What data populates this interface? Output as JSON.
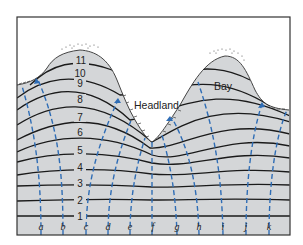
{
  "figure": {
    "labels": {
      "headland": "Headland",
      "bay": "Bay"
    },
    "crest_numbers": [
      "1",
      "2",
      "3",
      "4",
      "5",
      "6",
      "7",
      "8",
      "9",
      "10",
      "11"
    ],
    "orthogonal_letters": [
      "a",
      "b",
      "c",
      "d",
      "e",
      "f",
      "g",
      "h",
      "i",
      "j",
      "k"
    ],
    "colors": {
      "water": "#d4d6d8",
      "land": "#ffffff",
      "wave_crest": "#1a1a1a",
      "orthogonal": "#2f6db5",
      "frame": "#333333"
    }
  }
}
